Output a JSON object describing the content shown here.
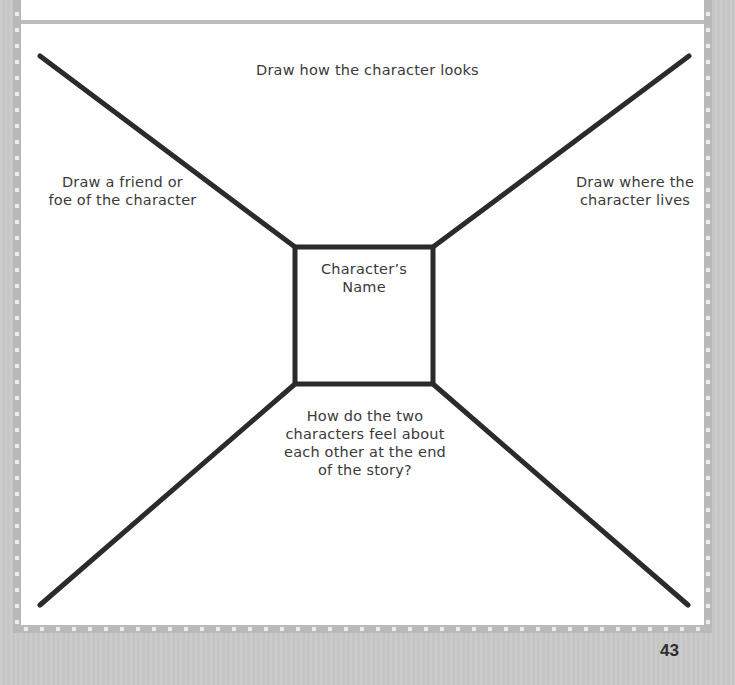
{
  "worksheet": {
    "prompts": {
      "top": "Draw how the character looks",
      "left_line1": "Draw a friend or",
      "left_line2": "foe of the character",
      "right_line1": "Draw where the",
      "right_line2": "character lives",
      "center_line1": "Character’s",
      "center_line2": "Name",
      "bottom_line1": "How do the two",
      "bottom_line2": "characters feel about",
      "bottom_line3": "each other at the end",
      "bottom_line4": "of the story?"
    }
  },
  "footer": {
    "page_number": "43"
  },
  "colors": {
    "line": "#2b2b2b",
    "paper": "#ffffff",
    "frame": "#b9b9b9",
    "page_background": "#c9c9c9"
  }
}
